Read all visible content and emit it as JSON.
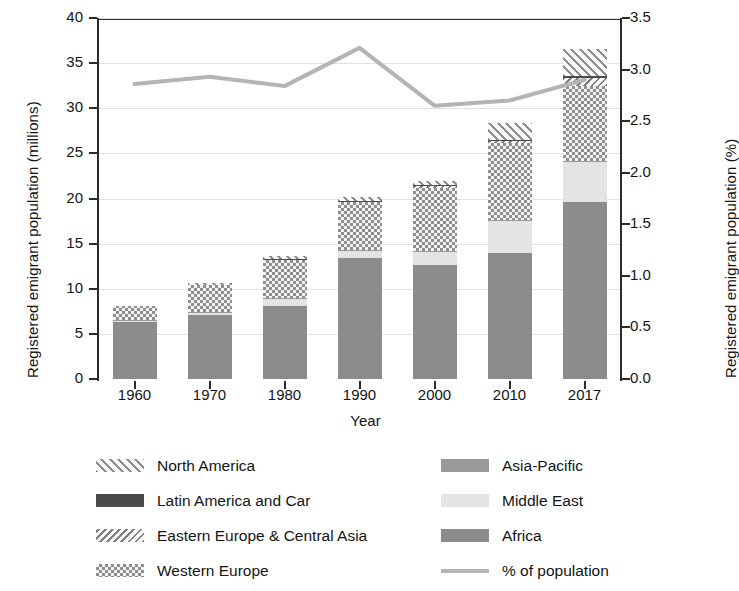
{
  "chart_data": {
    "type": "bar",
    "title": "",
    "xlabel": "Year",
    "ylabel": "Registered emigrant population (millions)",
    "ylabel_right": "Registered emigrant population (%)",
    "categories": [
      "1960",
      "1970",
      "1980",
      "1990",
      "2000",
      "2010",
      "2017"
    ],
    "ylim": [
      0,
      40
    ],
    "yticks": [
      "0",
      "5",
      "10",
      "15",
      "20",
      "25",
      "30",
      "35",
      "40"
    ],
    "ylim_right": [
      0.0,
      3.5
    ],
    "yticks_right": [
      "0.0",
      "0.5",
      "1.0",
      "1.5",
      "2.0",
      "2.5",
      "3.0",
      "3.5"
    ],
    "grid": true,
    "legend_position": "below",
    "stacked": true,
    "series": [
      {
        "name": "Africa",
        "key": "africa",
        "values": [
          6.3,
          7.1,
          8.1,
          13.4,
          12.6,
          14.0,
          19.6
        ]
      },
      {
        "name": "Middle East",
        "key": "middleeast",
        "values": [
          0.2,
          0.3,
          0.8,
          0.8,
          1.5,
          3.5,
          4.4
        ]
      },
      {
        "name": "Asia-Pacific",
        "key": "asiapacific",
        "values": [
          0.05,
          0.05,
          0.1,
          0.1,
          0.1,
          0.1,
          0.15
        ]
      },
      {
        "name": "Western Europe",
        "key": "westerneurope",
        "values": [
          1.6,
          3.0,
          4.2,
          5.3,
          7.0,
          8.6,
          8.3
        ]
      },
      {
        "name": "Eastern Europe & Central Asia",
        "key": "easterneurope",
        "values": [
          0.0,
          0.0,
          0.1,
          0.1,
          0.15,
          0.2,
          0.9
        ]
      },
      {
        "name": "Latin America and Car",
        "key": "latin",
        "values": [
          0.0,
          0.0,
          0.05,
          0.05,
          0.1,
          0.1,
          0.25
        ]
      },
      {
        "name": "North America",
        "key": "northamerica",
        "values": [
          0.1,
          0.2,
          0.25,
          0.45,
          0.45,
          1.9,
          3.0
        ]
      }
    ],
    "totals": [
      8.25,
      10.65,
      13.6,
      20.2,
      21.9,
      28.4,
      36.6
    ],
    "line_series": {
      "name": "% of population",
      "key": "pct",
      "axis": "right",
      "values": [
        2.86,
        2.93,
        2.84,
        3.21,
        2.65,
        2.7,
        2.9
      ],
      "values_left_scale": [
        32.7,
        33.5,
        32.4,
        36.7,
        30.3,
        30.9,
        33.1
      ],
      "color": "#b4b4b4"
    }
  },
  "legend": {
    "left_column": [
      {
        "label": "North America",
        "key": "northamerica"
      },
      {
        "label": "Latin America and Car",
        "key": "latin"
      },
      {
        "label": "Eastern Europe & Central Asia",
        "key": "easterneurope"
      },
      {
        "label": "Western Europe",
        "key": "westerneurope"
      }
    ],
    "right_column": [
      {
        "label": "Asia-Pacific",
        "key": "asiapacific"
      },
      {
        "label": "Middle East",
        "key": "middleeast"
      },
      {
        "label": "Africa",
        "key": "africa"
      },
      {
        "label": "% of population",
        "key": "pct"
      }
    ]
  },
  "colors": {
    "africa": "#8c8c8c",
    "middleeast": "#e4e4e4",
    "asiapacific": "#9a9a9a",
    "latin": "#4a4a4a",
    "westerneurope": "#8f8f8f",
    "northamerica": "#8f8f8f",
    "easterneurope": "#7e7e7e",
    "line": "#b4b4b4",
    "axis": "#2b2b2b",
    "grid": "#e2e2e2"
  }
}
